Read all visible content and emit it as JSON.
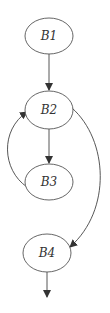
{
  "diagram": {
    "type": "control-flow-graph",
    "nodes": [
      {
        "id": "B1",
        "label": "B1",
        "cx": 49,
        "cy": 36,
        "rx": 24,
        "ry": 18
      },
      {
        "id": "B2",
        "label": "B2",
        "cx": 49,
        "cy": 110,
        "rx": 24,
        "ry": 19
      },
      {
        "id": "B3",
        "label": "B3",
        "cx": 49,
        "cy": 182,
        "rx": 24,
        "ry": 18
      },
      {
        "id": "B4",
        "label": "B4",
        "cx": 47,
        "cy": 253,
        "rx": 24,
        "ry": 19
      }
    ],
    "edges": [
      {
        "from": "B1",
        "to": "B2"
      },
      {
        "from": "B2",
        "to": "B3"
      },
      {
        "from": "B3",
        "to": "B2",
        "kind": "back-edge"
      },
      {
        "from": "B2",
        "to": "B4"
      },
      {
        "from": "B4",
        "to": "exit"
      }
    ],
    "colors": {
      "stroke": "#555555",
      "text": "#333333",
      "background": "#ffffff"
    }
  }
}
